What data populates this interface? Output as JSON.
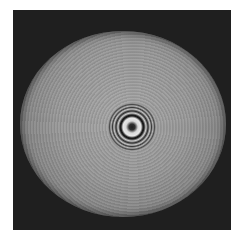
{
  "image": {
    "subject": "interference-ring-pattern",
    "colors": {
      "background": "#ffffff",
      "frame": "#1f1f1f",
      "disk": "#9a9a9a",
      "ring_dark": "#1a1a1a",
      "ring_light": "#e8e8e8"
    }
  }
}
